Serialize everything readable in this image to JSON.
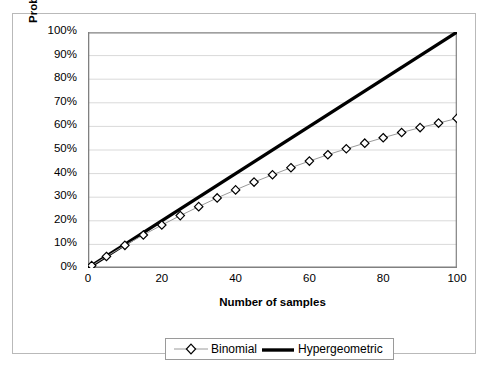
{
  "chart_data": {
    "type": "line",
    "title": "",
    "xlabel": "Number of samples",
    "ylabel": "Probability of one or more positive",
    "xlim": [
      0,
      100
    ],
    "ylim": [
      0,
      1
    ],
    "grid": true,
    "grid_axis": "y",
    "legend_position": "bottom",
    "xticks": [
      "0",
      "20",
      "40",
      "60",
      "80",
      "100"
    ],
    "xtick_values": [
      0,
      20,
      40,
      60,
      80,
      100
    ],
    "yticks": [
      "0%",
      "10%",
      "20%",
      "30%",
      "40%",
      "50%",
      "60%",
      "70%",
      "80%",
      "90%",
      "100%"
    ],
    "ytick_values": [
      0,
      0.1,
      0.2,
      0.3,
      0.4,
      0.5,
      0.6,
      0.7,
      0.8,
      0.9,
      1.0
    ],
    "series": [
      {
        "name": "Binomial",
        "marker": "diamond-open",
        "line_width": 1,
        "color": "#000000",
        "x": [
          1,
          5,
          10,
          15,
          20,
          25,
          30,
          35,
          40,
          45,
          50,
          55,
          60,
          65,
          70,
          75,
          80,
          85,
          90,
          95,
          100
        ],
        "values": [
          0.01,
          0.049,
          0.096,
          0.14,
          0.182,
          0.222,
          0.26,
          0.297,
          0.331,
          0.364,
          0.395,
          0.425,
          0.453,
          0.48,
          0.505,
          0.529,
          0.552,
          0.574,
          0.595,
          0.614,
          0.634
        ]
      },
      {
        "name": "Hypergeometric",
        "marker": "none",
        "line_width": 3,
        "color": "#000000",
        "x": [
          0,
          100
        ],
        "values": [
          0.0,
          1.0
        ]
      }
    ]
  },
  "legend": {
    "items": [
      {
        "label": "Binomial",
        "marker": "diamond-open"
      },
      {
        "label": "Hypergeometric",
        "marker": "thick-line"
      }
    ]
  },
  "colors": {
    "axis": "#808080",
    "grid": "#d9d9d9",
    "border": "#b9b9b9",
    "series": "#000000"
  }
}
